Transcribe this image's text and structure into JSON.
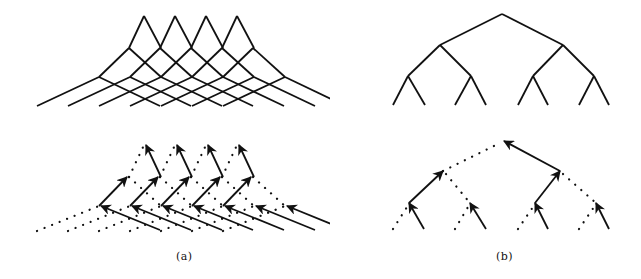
{
  "figure": {
    "panels": [
      {
        "id": "a",
        "label": "(a)",
        "description": "Four overlapping shifted binary trees (top) and their computation flow with solid arrows and dotted unused edges (bottom)",
        "top_tree": {
          "roots": [
            [
              144,
              16
            ],
            [
              175,
              16
            ],
            [
              206,
              16
            ],
            [
              237,
              16
            ]
          ],
          "level2_y": 48,
          "level2_x0": 129,
          "level3_y": 77,
          "level3_x0": 99,
          "leaf_y": 106,
          "spacing": 31
        },
        "bottom_flow": {
          "root_y": 145,
          "level2_y": 173,
          "level3_y": 202,
          "leaf_y": 230
        }
      },
      {
        "id": "b",
        "label": "(b)",
        "description": "Single binary tree (top) and its computation flow with solid arrows and dotted edges (bottom)"
      }
    ],
    "colors": {
      "line": "#111111",
      "background": "#ffffff"
    }
  }
}
